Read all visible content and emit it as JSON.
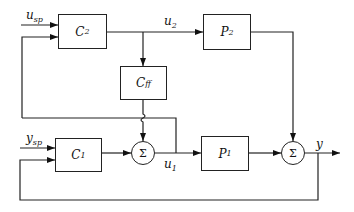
{
  "diagram": {
    "type": "block-diagram",
    "blocks": {
      "c2": {
        "main": "C",
        "sub": "2"
      },
      "p2": {
        "main": "P",
        "sub": "2"
      },
      "cff": {
        "main": "C",
        "sub": "ff"
      },
      "c1": {
        "main": "C",
        "sub": "1"
      },
      "p1": {
        "main": "P",
        "sub": "1"
      }
    },
    "sums": {
      "sum1": "Σ",
      "sum2": "Σ"
    },
    "signals": {
      "u_sp": {
        "main": "u",
        "sub": "sp"
      },
      "u2": {
        "main": "u",
        "sub": "2"
      },
      "y_sp": {
        "main": "y",
        "sub": "sp"
      },
      "u1": {
        "main": "u",
        "sub": "1"
      },
      "y": {
        "main": "y",
        "sub": ""
      }
    },
    "connections": [
      {
        "from": "u_sp",
        "to": "C2"
      },
      {
        "from": "u1",
        "to": "C2",
        "note": "feedback of u1 to C2"
      },
      {
        "from": "C2",
        "to": "P2",
        "signal": "u2"
      },
      {
        "from": "u2",
        "to": "Cff"
      },
      {
        "from": "Cff",
        "to": "Sum1"
      },
      {
        "from": "y_sp",
        "to": "C1"
      },
      {
        "from": "y",
        "to": "C1",
        "note": "feedback of y to C1"
      },
      {
        "from": "C1",
        "to": "Sum1"
      },
      {
        "from": "Sum1",
        "to": "P1",
        "signal": "u1"
      },
      {
        "from": "P1",
        "to": "Sum2"
      },
      {
        "from": "P2",
        "to": "Sum2"
      },
      {
        "from": "Sum2",
        "to": "output",
        "signal": "y"
      }
    ]
  }
}
